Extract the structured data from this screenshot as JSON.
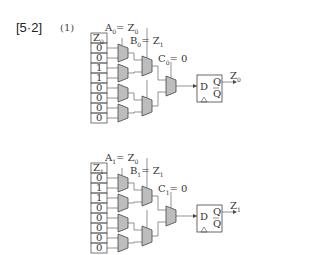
{
  "header": {
    "problem_number": "[5·2]",
    "part": "(1)"
  },
  "circuits": [
    {
      "name": "bit0",
      "column_header": "Z",
      "column_header_sub": "0",
      "column_values": [
        "0",
        "0",
        "1",
        "1",
        "0",
        "0",
        "0",
        "0"
      ],
      "select_a": {
        "name": "A",
        "sub": "0",
        "eq": "= Z",
        "eq_sub": "0"
      },
      "select_b": {
        "name": "B",
        "sub": "0",
        "eq": "= Z",
        "eq_sub": "1"
      },
      "select_c": {
        "name": "C",
        "sub": "0",
        "eq": "= 0"
      },
      "flipflop": {
        "d": "D",
        "q": "Q",
        "qbar": "Q",
        "clock": "△"
      },
      "output": {
        "name": "Z",
        "sub": "0"
      }
    },
    {
      "name": "bit1",
      "column_header": "Z",
      "column_header_sub": "1",
      "column_values": [
        "0",
        "1",
        "1",
        "0",
        "0",
        "0",
        "0",
        "0"
      ],
      "select_a": {
        "name": "A",
        "sub": "1",
        "eq": "= Z",
        "eq_sub": "0"
      },
      "select_b": {
        "name": "B",
        "sub": "1",
        "eq": "= Z",
        "eq_sub": "1"
      },
      "select_c": {
        "name": "C",
        "sub": "1",
        "eq": "= 0"
      },
      "flipflop": {
        "d": "D",
        "q": "Q",
        "qbar": "Q",
        "clock": "△"
      },
      "output": {
        "name": "Z",
        "sub": "1"
      }
    }
  ]
}
